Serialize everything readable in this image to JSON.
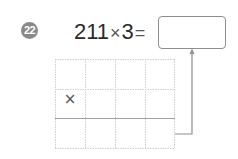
{
  "problem": {
    "number": "22",
    "multiplicand": "211",
    "operator": "×",
    "multiplier": "3",
    "equals": "=",
    "answer": ""
  },
  "grid": {
    "columns": 4,
    "rows": 3,
    "multiply_sign": "×",
    "cells": [
      [
        "",
        "",
        "",
        ""
      ],
      [
        "×",
        "",
        "",
        ""
      ],
      [
        "",
        "",
        "",
        ""
      ]
    ]
  },
  "colors": {
    "badge": "#8a8a8a",
    "grid_line": "#c8c8c8",
    "separator_line": "#9a9a9a",
    "arrow": "#8e8e8e"
  }
}
